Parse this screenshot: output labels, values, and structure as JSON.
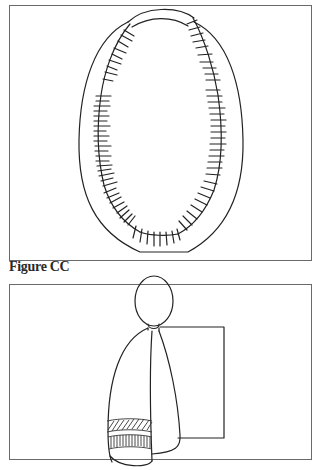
{
  "figures": [
    {
      "id": "figure-upper",
      "description": "Oval collar/yoke outline with fringed ladder-like stitched band along inner edge"
    },
    {
      "id": "figure-cc",
      "caption": "Figure CC",
      "description": "Doll-like figure with oval head, draped cloak with hatched and striped bands, standing in front of a square panel"
    }
  ],
  "colors": {
    "line": "#222222",
    "frame": "#6a6a6a",
    "background": "#ffffff"
  }
}
